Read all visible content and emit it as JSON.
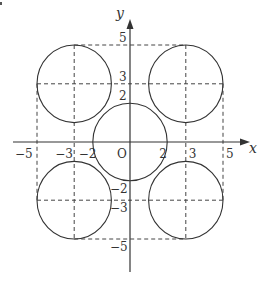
{
  "diagram": {
    "axes": {
      "x_label": "x",
      "y_label": "y",
      "origin_label": "O"
    },
    "x_ticks": [
      {
        "value": -5,
        "label": "−5"
      },
      {
        "value": -3,
        "label": "−3"
      },
      {
        "value": -2,
        "label": "−2"
      },
      {
        "value": 2,
        "label": "2"
      },
      {
        "value": 3,
        "label": "3"
      },
      {
        "value": 5,
        "label": "5"
      }
    ],
    "y_ticks": [
      {
        "value": 5,
        "label": "5"
      },
      {
        "value": 3,
        "label": "3"
      },
      {
        "value": 2,
        "label": "2"
      },
      {
        "value": -2,
        "label": "−2"
      },
      {
        "value": -3,
        "label": "−3"
      },
      {
        "value": -5,
        "label": "−5"
      }
    ],
    "circles": [
      {
        "name": "center-circle",
        "cx": 0,
        "cy": 0,
        "r": 2
      },
      {
        "name": "top-left-circle",
        "cx": -3,
        "cy": 3,
        "r": 2
      },
      {
        "name": "top-right-circle",
        "cx": 3,
        "cy": 3,
        "r": 2
      },
      {
        "name": "bottom-left-circle",
        "cx": -3,
        "cy": -3,
        "r": 2
      },
      {
        "name": "bottom-right-circle",
        "cx": 3,
        "cy": -3,
        "r": 2
      }
    ],
    "dashed_lines": [
      {
        "name": "dash-h-y5",
        "x1": -3,
        "y1": 5,
        "x2": 3,
        "y2": 5
      },
      {
        "name": "dash-h-y3",
        "x1": -5,
        "y1": 3,
        "x2": 5,
        "y2": 3
      },
      {
        "name": "dash-h-ym3",
        "x1": -5,
        "y1": -3,
        "x2": 5,
        "y2": -3
      },
      {
        "name": "dash-h-ym5",
        "x1": -3,
        "y1": -5,
        "x2": 3,
        "y2": -5
      },
      {
        "name": "dash-v-xm3",
        "x1": -3,
        "y1": 5,
        "x2": -3,
        "y2": -5
      },
      {
        "name": "dash-v-x3",
        "x1": 3,
        "y1": 5,
        "x2": 3,
        "y2": -5
      },
      {
        "name": "dash-v-xm5",
        "x1": -5,
        "y1": 3,
        "x2": -5,
        "y2": -3
      },
      {
        "name": "dash-v-x5",
        "x1": 5,
        "y1": 3,
        "x2": 5,
        "y2": -3
      }
    ],
    "colors": {
      "stroke": "#333333",
      "dash": "#444444"
    }
  }
}
